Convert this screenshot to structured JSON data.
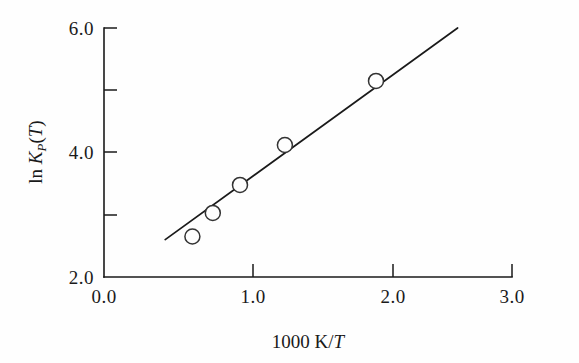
{
  "chart_data": {
    "type": "scatter",
    "title": "",
    "xlabel": "1000 K/T",
    "ylabel": "ln K_P(T)",
    "xlim": [
      0.0,
      3.0
    ],
    "ylim": [
      2.0,
      6.0
    ],
    "grid": false,
    "legend": null,
    "x_ticks": [
      "0.0",
      "1.0",
      "2.0",
      "3.0"
    ],
    "x_tick_values": [
      0.0,
      1.0,
      2.0,
      3.0
    ],
    "x_minor_ticks": [],
    "y_ticks": [
      "2.0",
      "4.0",
      "6.0"
    ],
    "y_tick_values": [
      2.0,
      4.0,
      6.0
    ],
    "y_minor_tick_values": [
      3.0,
      5.0
    ],
    "points": [
      {
        "x": 0.65,
        "y": 2.65
      },
      {
        "x": 0.8,
        "y": 3.03
      },
      {
        "x": 1.0,
        "y": 3.48
      },
      {
        "x": 1.33,
        "y": 4.12
      },
      {
        "x": 2.0,
        "y": 5.15
      }
    ],
    "series": [
      {
        "name": "data",
        "marker": "open-circle",
        "x": [
          0.65,
          0.8,
          1.0,
          1.33,
          2.0
        ],
        "values": [
          2.65,
          3.03,
          3.48,
          4.12,
          5.15
        ]
      },
      {
        "name": "fit-line",
        "marker": "none",
        "x": [
          0.45,
          2.6
        ],
        "values": [
          2.6,
          6.0
        ]
      }
    ]
  },
  "labels": {
    "x_axis": {
      "prefix": "1000 K/",
      "variable": "T"
    },
    "y_axis": {
      "ln": "ln",
      "k": "K",
      "subscript": "P",
      "open_paren": "(",
      "variable": "T",
      "close_paren": ")"
    },
    "x_tick_0": "0.0",
    "x_tick_1": "1.0",
    "x_tick_2": "2.0",
    "x_tick_3": "3.0",
    "y_tick_0": "2.0",
    "y_tick_1": "4.0",
    "y_tick_2": "6.0"
  },
  "colors": {
    "axis": "#1a1a1a",
    "marker_stroke": "#333333",
    "marker_fill": "#fefefe",
    "line": "#1a1a1a",
    "background": "#fefefe"
  }
}
